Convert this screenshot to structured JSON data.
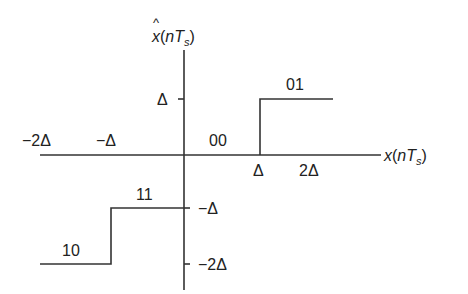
{
  "diagram": {
    "type": "quantizer-staircase",
    "y_axis_label": {
      "symbol": "x",
      "hat": "^",
      "arg_open": "(",
      "n": "n",
      "T": "T",
      "sub": "s",
      "arg_close": ")"
    },
    "x_axis_label": {
      "symbol": "x",
      "arg_open": "(",
      "n": "n",
      "T": "T",
      "sub": "s",
      "arg_close": ")"
    },
    "x_ticks": [
      "−2Δ",
      "−Δ",
      "Δ",
      "2Δ"
    ],
    "y_ticks": [
      "Δ",
      "−Δ",
      "−2Δ"
    ],
    "codes": [
      "01",
      "00",
      "11",
      "10"
    ],
    "levels": [
      {
        "code": "10",
        "x_range": "x < −Δ",
        "output": "−2Δ"
      },
      {
        "code": "11",
        "x_range": "−Δ ≤ x < 0",
        "output": "−Δ"
      },
      {
        "code": "00",
        "x_range": "0 ≤ x < Δ",
        "output": "0"
      },
      {
        "code": "01",
        "x_range": "x ≥ Δ",
        "output": "Δ"
      }
    ],
    "line_color": "#333333"
  }
}
